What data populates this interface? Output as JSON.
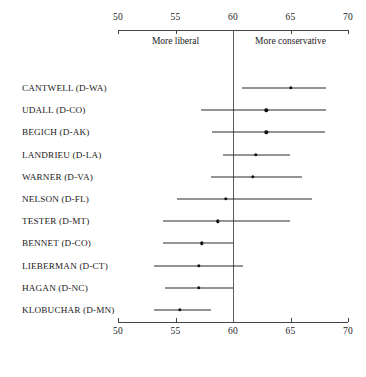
{
  "chart_data": {
    "type": "scatter",
    "title": "",
    "xlabel": "",
    "ylabel": "",
    "xlim": [
      50,
      70
    ],
    "xticks": [
      50,
      55,
      60,
      65,
      70
    ],
    "xtick_labels": [
      "50",
      "55",
      "60",
      "65",
      "70"
    ],
    "grid": false,
    "legend": "none",
    "reference_line": 60,
    "annotations": [
      {
        "text": "More liberal",
        "x": 55,
        "side": "left"
      },
      {
        "text": "More conservative",
        "x": 65,
        "side": "right"
      }
    ],
    "categories": [
      "CANTWELL (D-WA)",
      "UDALL (D-CO)",
      "BEGICH (D-AK)",
      "LANDRIEU (D-LA)",
      "WARNER (D-VA)",
      "NELSON (D-FL)",
      "TESTER (D-MT)",
      "BENNET (D-CO)",
      "LIEBERMAN (D-CT)",
      "HAGAN (D-NC)",
      "KLOBUCHAR (D-MN)"
    ],
    "points": [
      {
        "label": "CANTWELL (D-WA)",
        "value": 65.0,
        "low": 60.8,
        "high": 68.1
      },
      {
        "label": "UDALL (D-CO)",
        "value": 62.9,
        "low": 57.2,
        "high": 68.1
      },
      {
        "label": "BEGICH (D-AK)",
        "value": 62.9,
        "low": 58.2,
        "high": 68.0
      },
      {
        "label": "LANDRIEU (D-LA)",
        "value": 62.0,
        "low": 59.1,
        "high": 65.0
      },
      {
        "label": "WARNER (D-VA)",
        "value": 61.7,
        "low": 58.1,
        "high": 66.0
      },
      {
        "label": "NELSON (D-FL)",
        "value": 59.4,
        "low": 55.1,
        "high": 66.9
      },
      {
        "label": "TESTER (D-MT)",
        "value": 58.7,
        "low": 53.9,
        "high": 65.0
      },
      {
        "label": "BENNET (D-CO)",
        "value": 57.3,
        "low": 53.9,
        "high": 60.0
      },
      {
        "label": "LIEBERMAN (D-CT)",
        "value": 57.0,
        "low": 53.1,
        "high": 60.9
      },
      {
        "label": "HAGAN (D-NC)",
        "value": 57.0,
        "low": 54.1,
        "high": 60.0
      },
      {
        "label": "KLOBUCHAR (D-MN)",
        "value": 55.4,
        "low": 53.1,
        "high": 58.1
      }
    ],
    "colors": {
      "point": "#111111",
      "interval": "#2b2b2b",
      "axis": "#444444",
      "reference": "#5a5a66",
      "text": "#1a1a1a",
      "background": "#ffffff"
    }
  },
  "layout": {
    "plot_left_px": 118,
    "plot_right_px": 348,
    "top_axis_y_px": 30,
    "bottom_axis_y_px": 322,
    "first_row_y_px": 88,
    "row_spacing_px": 22.2,
    "label_right_px": 112,
    "top_tick_label_y_px": 12,
    "bottom_tick_label_y_px": 326,
    "direction_label_y_px": 36
  }
}
